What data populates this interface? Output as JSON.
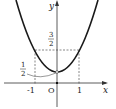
{
  "figure": {
    "function": "y = x^2 + 1/2",
    "axes": {
      "x_label": "x",
      "y_label": "y",
      "origin_label": "O"
    },
    "x_ticks": [
      "-1",
      "1"
    ],
    "annotations": {
      "y_three_halves": {
        "num": "3",
        "den": "2"
      },
      "y_one_half": {
        "num": "1",
        "den": "2"
      }
    },
    "colors": {
      "curve": "#1a1a1a",
      "axis": "#333333",
      "dashed": "#555555"
    }
  }
}
